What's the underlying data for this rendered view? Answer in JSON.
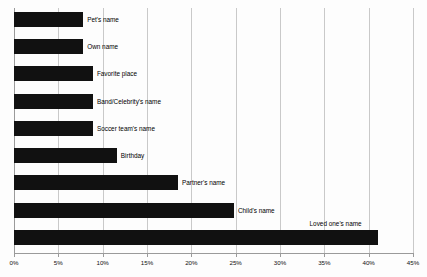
{
  "chart_data": {
    "type": "bar",
    "orientation": "horizontal",
    "title": "",
    "subtitle": "",
    "xlabel": "",
    "ylabel": "",
    "xlim": [
      0,
      45
    ],
    "x_tick_labels": [
      "0%",
      "5%",
      "10%",
      "15%",
      "20%",
      "25%",
      "30%",
      "35%",
      "40%",
      "45%"
    ],
    "x_tick_values": [
      0,
      5,
      10,
      15,
      20,
      25,
      30,
      35,
      40,
      45
    ],
    "x_unit": "%",
    "grid": "vertical",
    "legend": "none",
    "categories": [
      "Pet's name",
      "Own name",
      "Favorite place",
      "Band/Celebrity's name",
      "Soccer team's name",
      "Birthday",
      "Partner's name",
      "Child's name",
      "Loved one's name"
    ],
    "values": [
      7.8,
      7.8,
      8.9,
      8.9,
      8.9,
      11.6,
      18.5,
      24.8,
      41.0
    ],
    "bars": [
      {
        "label": "Pet's name",
        "value": 7.8,
        "label_position": "right"
      },
      {
        "label": "Own name",
        "value": 7.8,
        "label_position": "right"
      },
      {
        "label": "Favorite place",
        "value": 8.9,
        "label_position": "right"
      },
      {
        "label": "Band/Celebrity's name",
        "value": 8.9,
        "label_position": "right"
      },
      {
        "label": "Soccer team's name",
        "value": 8.9,
        "label_position": "right"
      },
      {
        "label": "Birthday",
        "value": 11.6,
        "label_position": "right"
      },
      {
        "label": "Partner's name",
        "value": 18.5,
        "label_position": "right"
      },
      {
        "label": "Child's name",
        "value": 24.8,
        "label_position": "right"
      },
      {
        "label": "Loved one's name",
        "value": 41.0,
        "label_position": "above"
      }
    ],
    "colors": {
      "bar": "#111111",
      "background": "#fdfdfd",
      "gridline": "#c9c9c9",
      "axis": "#9a9a9a",
      "text": "#000000"
    }
  }
}
